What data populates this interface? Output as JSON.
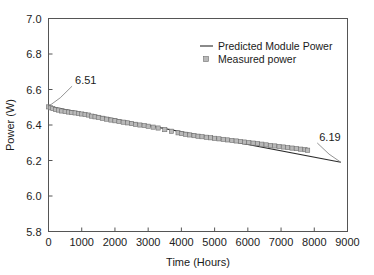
{
  "chart_data": {
    "type": "line",
    "title": "",
    "xlabel": "Time (Hours)",
    "ylabel": "Power (W)",
    "xlim": [
      0,
      9000
    ],
    "ylim": [
      5.8,
      7.0
    ],
    "xticks": [
      0,
      1000,
      2000,
      3000,
      4000,
      5000,
      6000,
      7000,
      8000,
      9000
    ],
    "yticks": [
      5.8,
      6.0,
      6.2,
      6.4,
      6.6,
      6.8,
      7.0
    ],
    "xtick_labels": [
      "0",
      "1000",
      "2000",
      "3000",
      "4000",
      "5000",
      "6000",
      "7000",
      "8000",
      "9000"
    ],
    "ytick_labels": [
      "5.8",
      "6.0",
      "6.2",
      "6.4",
      "6.6",
      "6.8",
      "7.0"
    ],
    "grid": false,
    "legend_position": "upper right inside",
    "series": [
      {
        "name": "Predicted Module Power",
        "style": "line",
        "color": "#2b2b2b",
        "x": [
          0,
          8800
        ],
        "values": [
          6.505,
          6.19
        ]
      },
      {
        "name": "Measured power",
        "style": "scatter-square",
        "color": "#b9b9b9",
        "edge_color": "#6f6f6f",
        "x": [
          0,
          60,
          130,
          210,
          300,
          400,
          500,
          600,
          700,
          800,
          900,
          1000,
          1100,
          1200,
          1300,
          1400,
          1500,
          1620,
          1750,
          1880,
          2000,
          2120,
          2250,
          2380,
          2500,
          2620,
          2750,
          2880,
          3000,
          3150,
          3300,
          3500,
          3700,
          3900,
          4000,
          4120,
          4250,
          4380,
          4500,
          4620,
          4750,
          4880,
          5000,
          5130,
          5260,
          5390,
          5520,
          5650,
          5780,
          5900,
          6030,
          6160,
          6290,
          6420,
          6550,
          6680,
          6810,
          6940,
          7070,
          7200,
          7330,
          7460,
          7590,
          7720,
          7800
        ],
        "values": [
          6.502,
          6.497,
          6.493,
          6.487,
          6.484,
          6.479,
          6.476,
          6.473,
          6.47,
          6.468,
          6.465,
          6.462,
          6.459,
          6.456,
          6.45,
          6.446,
          6.443,
          6.438,
          6.433,
          6.428,
          6.424,
          6.42,
          6.416,
          6.412,
          6.408,
          6.404,
          6.4,
          6.397,
          6.393,
          6.388,
          6.383,
          6.374,
          6.365,
          6.356,
          6.352,
          6.348,
          6.344,
          6.34,
          6.337,
          6.334,
          6.331,
          6.328,
          6.325,
          6.322,
          6.319,
          6.316,
          6.313,
          6.31,
          6.307,
          6.304,
          6.301,
          6.298,
          6.295,
          6.292,
          6.288,
          6.285,
          6.282,
          6.279,
          6.276,
          6.273,
          6.27,
          6.267,
          6.264,
          6.261,
          6.258
        ]
      }
    ],
    "annotations": [
      {
        "text": "6.51",
        "x": 800,
        "y": 6.63,
        "points_to_x": 0,
        "points_to_y": 6.505
      },
      {
        "text": "6.19",
        "x": 8150,
        "y": 6.31,
        "points_to_x": 8800,
        "points_to_y": 6.19
      }
    ]
  },
  "legend": {
    "entries": [
      {
        "label": "Predicted Module Power",
        "symbol": "line"
      },
      {
        "label": "Measured power",
        "symbol": "square"
      }
    ]
  }
}
